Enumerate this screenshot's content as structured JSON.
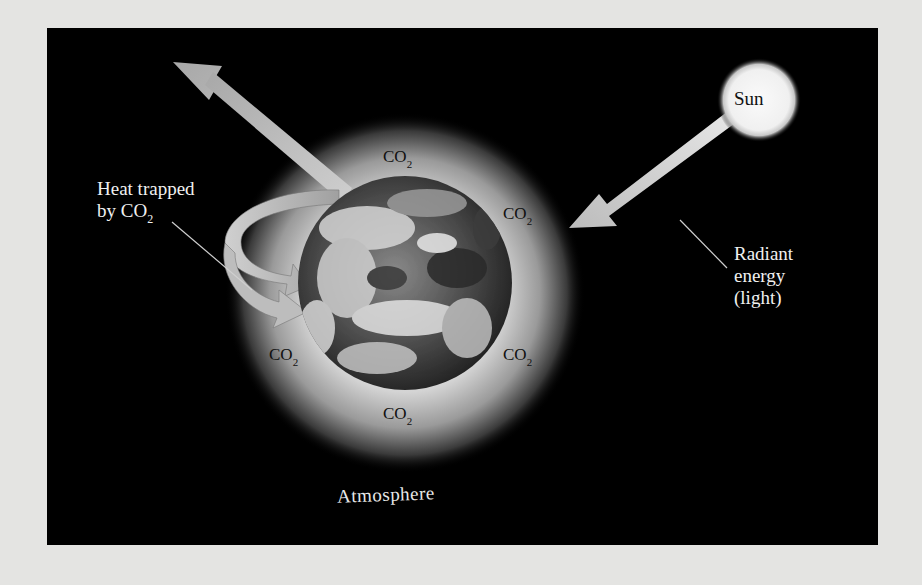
{
  "diagram": {
    "sun": {
      "label": "Sun"
    },
    "incoming_label": {
      "lines": [
        "Radiant",
        "energy",
        "(light)"
      ]
    },
    "trapped_label": {
      "line1": "Heat trapped",
      "line2_prefix": "by CO",
      "line2_sub": "2"
    },
    "molecule": {
      "formula": "CO",
      "subscript": "2",
      "count": 6
    },
    "atmosphere_label": "Atmosphere",
    "colors": {
      "background": "#000000",
      "page": "#e4e4e2",
      "arrow": "#b8b8b8",
      "sun": "#f4f4f4",
      "glow": "#d8d8d8",
      "text_light": "#f0f0f0",
      "text_dark": "#111111"
    }
  }
}
